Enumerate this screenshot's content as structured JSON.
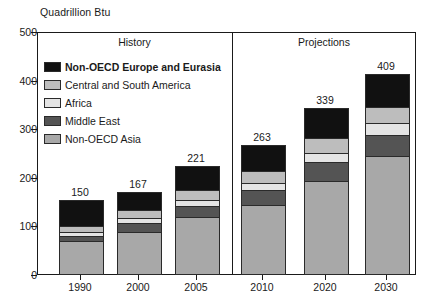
{
  "chart_data": {
    "type": "bar",
    "subtype": "stacked-bar",
    "title": "",
    "ylabel": "Quadrillion Btu",
    "xlabel": "",
    "ylim": [
      0,
      500
    ],
    "yticks": [
      0,
      100,
      200,
      300,
      400,
      500
    ],
    "ytick_labels": [
      "0",
      "100",
      "200",
      "300",
      "400",
      "500"
    ],
    "grid": false,
    "legend_position": "inside-top-left",
    "categories": [
      "1990",
      "2000",
      "2005",
      "2010",
      "2020",
      "2030"
    ],
    "totals": [
      150,
      167,
      221,
      263,
      339,
      409
    ],
    "series": [
      {
        "name": "Non-OECD Asia",
        "color": "#a8a8a8",
        "values": [
          65,
          85,
          115,
          140,
          190,
          240
        ]
      },
      {
        "name": "Middle East",
        "color": "#545454",
        "values": [
          12,
          17,
          23,
          30,
          38,
          45
        ]
      },
      {
        "name": "Africa",
        "color": "#e4e4e4",
        "values": [
          8,
          11,
          13,
          16,
          20,
          24
        ]
      },
      {
        "name": "Central and South America",
        "color": "#bdbdbd",
        "values": [
          12,
          16,
          20,
          24,
          30,
          33
        ]
      },
      {
        "name": "Non-OECD Europe and Eurasia",
        "color": "#111111",
        "values": [
          53,
          38,
          50,
          53,
          61,
          67
        ]
      }
    ],
    "panels": [
      {
        "label": "History",
        "categories": [
          "1990",
          "2000",
          "2005"
        ]
      },
      {
        "label": "Projections",
        "categories": [
          "2010",
          "2020",
          "2030"
        ]
      }
    ],
    "annotations": []
  },
  "axis": {
    "y_title": "Quadrillion Btu"
  },
  "panels": {
    "history_label": "History",
    "projections_label": "Projections"
  },
  "legend": {
    "items": [
      {
        "label": "Non-OECD Europe and Eurasia",
        "color": "#111111",
        "bold": true
      },
      {
        "label": "Central and South America",
        "color": "#bdbdbd",
        "bold": false
      },
      {
        "label": "Africa",
        "color": "#e4e4e4",
        "bold": false
      },
      {
        "label": "Middle East",
        "color": "#545454",
        "bold": false
      },
      {
        "label": "Non-OECD Asia",
        "color": "#a8a8a8",
        "bold": false
      }
    ]
  }
}
